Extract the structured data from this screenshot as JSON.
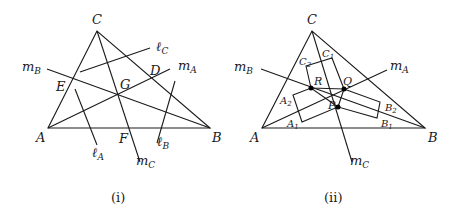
{
  "figures": [
    {
      "caption": "(i)",
      "vertices": {
        "C": "C",
        "A": "A",
        "B": "B"
      },
      "points": {
        "D": "D",
        "E": "E",
        "F": "F",
        "G": "G"
      },
      "lines": {
        "mA": {
          "base": "m",
          "sub": "A"
        },
        "mB": {
          "base": "m",
          "sub": "B"
        },
        "mC": {
          "base": "m",
          "sub": "C"
        },
        "lA": {
          "base": "ℓ",
          "sub": "A"
        },
        "lB": {
          "base": "ℓ",
          "sub": "B"
        },
        "lC": {
          "base": "ℓ",
          "sub": "C"
        }
      }
    },
    {
      "caption": "(ii)",
      "vertices": {
        "C": "C",
        "A": "A",
        "B": "B"
      },
      "points": {
        "P": "P",
        "Q": "Q",
        "R": "R"
      },
      "rect_corners": {
        "A1": {
          "base": "A",
          "sub": "1"
        },
        "A2": {
          "base": "A",
          "sub": "2"
        },
        "B1": {
          "base": "B",
          "sub": "1"
        },
        "B2": {
          "base": "B",
          "sub": "2"
        },
        "C1": {
          "base": "C",
          "sub": "1"
        },
        "C2": {
          "base": "C",
          "sub": "2"
        }
      },
      "lines": {
        "mA": {
          "base": "m",
          "sub": "A"
        },
        "mB": {
          "base": "m",
          "sub": "B"
        },
        "mC": {
          "base": "m",
          "sub": "C"
        }
      }
    }
  ]
}
